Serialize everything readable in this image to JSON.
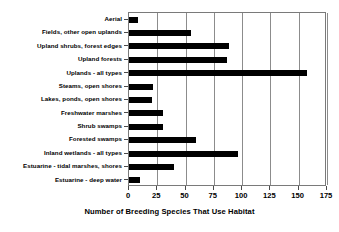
{
  "chart_data": {
    "type": "bar",
    "orientation": "horizontal",
    "title": "",
    "xlabel": "Number of Breeding Species That Use Habitat",
    "ylabel": "",
    "xlim": [
      0,
      175
    ],
    "xticks": [
      0,
      25,
      50,
      75,
      100,
      125,
      150,
      175
    ],
    "xtick_labels": [
      "0",
      "25",
      "50",
      "75",
      "100",
      "125",
      "150",
      "175"
    ],
    "grid": "vertical",
    "legend": "none",
    "bar_color": "#000000",
    "categories": [
      "Aerial",
      "Fields, other open uplands",
      "Upland shrubs, forest edges",
      "Upland forests",
      "Uplands - all types",
      "Steams, open shores",
      "Lakes, ponds, open shores",
      "Freshwater marshes",
      "Shrub swamps",
      "Forested swamps",
      "Inland wetlands - all types",
      "Estuarine - tidal marshes, shores",
      "Estuarine - deep water"
    ],
    "values": [
      8,
      55,
      88,
      87,
      157,
      21,
      20,
      30,
      30,
      59,
      96,
      40,
      10
    ]
  }
}
